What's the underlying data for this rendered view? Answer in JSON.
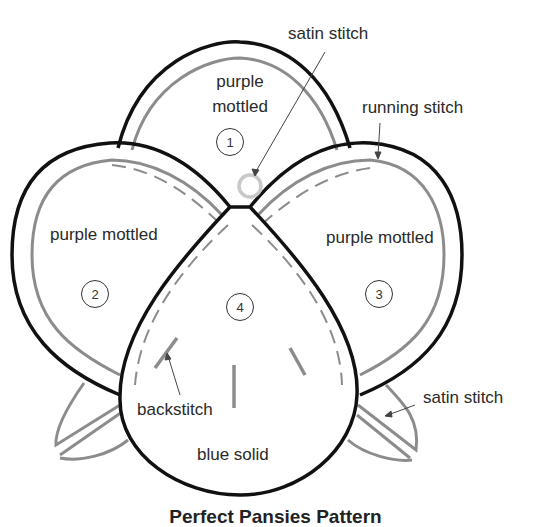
{
  "diagram": {
    "caption": "Perfect Pansies Pattern",
    "petals": [
      {
        "number": "1",
        "fabric": "purple mottled",
        "fabric_line1": "purple",
        "fabric_line2": "mottled"
      },
      {
        "number": "2",
        "fabric": "purple mottled"
      },
      {
        "number": "3",
        "fabric": "purple mottled"
      },
      {
        "number": "4",
        "fabric": "blue solid"
      }
    ],
    "callouts": {
      "satin_top": "satin stitch",
      "running": "running stitch",
      "backstitch": "backstitch",
      "satin_right": "satin stitch"
    },
    "colors": {
      "outline": "#111111",
      "stitch_gray": "#8c8c8c",
      "background": "#ffffff"
    }
  }
}
